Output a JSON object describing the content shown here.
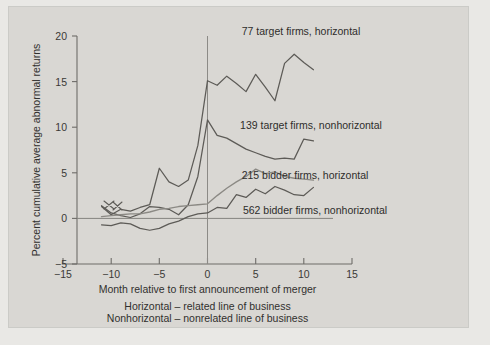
{
  "chart_data": {
    "type": "line",
    "title": "",
    "xlabel": "Month relative to first announcement of merger",
    "ylabel": "Percent cumulative average abnormal returns",
    "xlim": [
      -15,
      15
    ],
    "ylim": [
      -5,
      20
    ],
    "xticks": [
      -15,
      -10,
      -5,
      0,
      5,
      10,
      15
    ],
    "xtick_labels": [
      "−15",
      "−10",
      "−5",
      "0",
      "5",
      "10",
      "15"
    ],
    "yticks": [
      -5,
      0,
      5,
      10,
      15,
      20
    ],
    "ytick_labels": [
      "−5",
      "0",
      "5",
      "10",
      "15",
      "20"
    ],
    "grid": false,
    "legend_position": "inline-right",
    "annotations": [
      "Horizontal – related line of business",
      "Nonhorizontal – nonrelated line of business"
    ],
    "reference_lines": [
      {
        "name": "zero-return",
        "orientation": "horizontal",
        "value": 0
      },
      {
        "name": "announcement-month",
        "orientation": "vertical",
        "value": 0
      }
    ],
    "x": [
      -11,
      -10,
      -9,
      -8,
      -7,
      -6,
      -5,
      -4,
      -3,
      -2,
      -1,
      0,
      1,
      2,
      3,
      4,
      5,
      6,
      7,
      8,
      9,
      10,
      11
    ],
    "series": [
      {
        "name": "77 target firms, horizontal",
        "color": "#5d5b57",
        "label": "77 target firms, horizontal",
        "values": [
          1.3,
          0.4,
          1.0,
          0.8,
          1.2,
          1.5,
          5.5,
          4.0,
          3.5,
          4.2,
          8.0,
          15.1,
          14.6,
          15.6,
          14.8,
          13.9,
          15.8,
          14.4,
          12.9,
          17.0,
          18.0,
          17.1,
          16.3
        ]
      },
      {
        "name": "139 target firms, nonhorizontal",
        "color": "#5d5b57",
        "label": "139 target firms, nonhorizontal",
        "values": [
          1.4,
          0.6,
          0.3,
          0.1,
          0.5,
          1.3,
          1.2,
          1.0,
          0.4,
          1.5,
          4.6,
          10.8,
          9.1,
          8.8,
          8.2,
          7.6,
          7.2,
          6.8,
          6.5,
          6.6,
          6.5,
          8.7,
          8.5
        ]
      },
      {
        "name": "215 bidder firms, horizontal",
        "color": "#8b8984",
        "label": "215 bidder firms, horizontal",
        "values": [
          0.2,
          0.3,
          0.4,
          0.5,
          0.5,
          0.7,
          1.0,
          1.1,
          1.3,
          1.4,
          1.5,
          1.6,
          2.5,
          3.3,
          4.0,
          4.6,
          5.4,
          4.9,
          5.1,
          4.6,
          4.4,
          4.3,
          4.2
        ]
      },
      {
        "name": "562 bidder firms, nonhorizontal",
        "color": "#5d5b57",
        "label": "562 bidder firms, nonhorizontal",
        "values": [
          -0.7,
          -0.8,
          -0.5,
          -0.6,
          -1.1,
          -1.3,
          -1.1,
          -0.6,
          -0.3,
          0.2,
          0.5,
          0.6,
          1.2,
          1.1,
          2.6,
          2.3,
          3.2,
          2.7,
          3.5,
          3.1,
          2.6,
          2.5,
          3.4
        ]
      }
    ],
    "crossing_marks": [
      {
        "name": "x-crossing-left",
        "x": -11.0,
        "y": 1.3
      },
      {
        "name": "x-crossing-right",
        "x": -10.2,
        "y": 0.9
      }
    ]
  },
  "labels": {
    "series_0": "77 target firms, horizontal",
    "series_1": "139 target firms, nonhorizontal",
    "series_2": "215 bidder firms, horizontal",
    "series_3": "562 bidder firms, nonhorizontal",
    "xaxis": "Month relative to first announcement of merger",
    "yaxis": "Percent cumulative average abnormal returns",
    "caption_1": "Horizontal – related line of business",
    "caption_2": "Nonhorizontal – nonrelated line of business",
    "ytick_20": "20",
    "ytick_15": "15",
    "ytick_10": "10",
    "ytick_5": "5",
    "ytick_0": "0",
    "ytick_m5": "−5",
    "xtick_m15": "−15",
    "xtick_m10": "−10",
    "xtick_m5": "−5",
    "xtick_0": "0",
    "xtick_5": "5",
    "xtick_10": "10",
    "xtick_15": "15"
  },
  "colors": {
    "page_background": "#e9e8e5",
    "plate_background": "#d9d7d3",
    "axis": "#6e6c69",
    "dark_series": "#5d5b57",
    "light_series": "#8b8984",
    "text": "#31302e"
  }
}
